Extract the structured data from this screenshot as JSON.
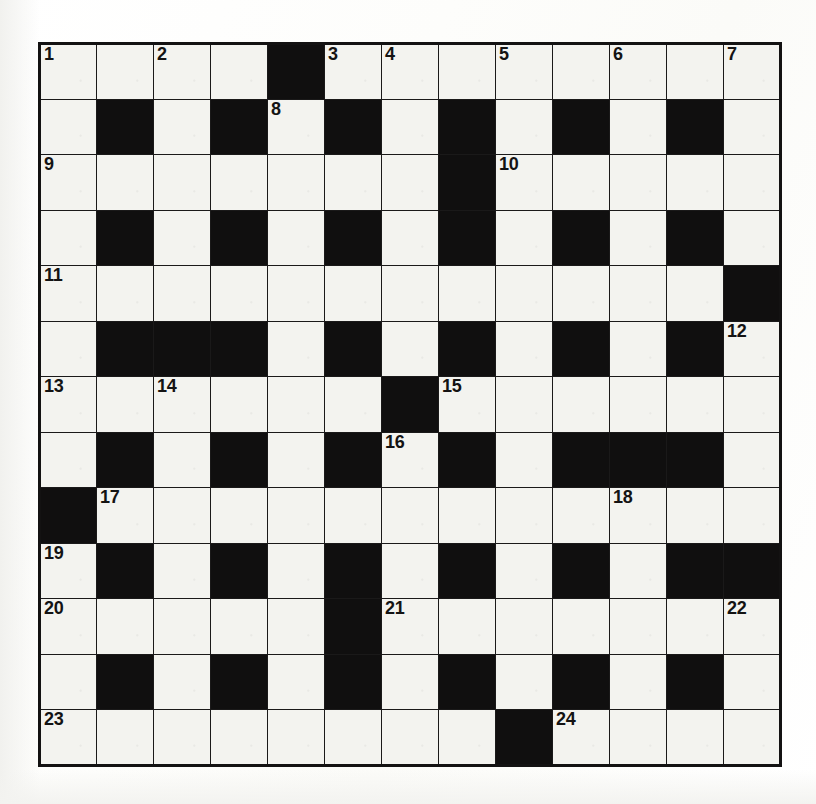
{
  "puzzle": {
    "kind": "crossword-grid",
    "columns": 13,
    "rows": 13,
    "colors": {
      "block": "#100f0f",
      "cell": "#f3f3ef",
      "grid_line": "#1a1919",
      "number_text": "#141313",
      "page_background": "#ffffff"
    },
    "number_labels": [
      "1",
      "2",
      "3",
      "4",
      "5",
      "6",
      "7",
      "8",
      "9",
      "10",
      "11",
      "12",
      "13",
      "14",
      "15",
      "16",
      "17",
      "18",
      "19",
      "20",
      "21",
      "22",
      "23",
      "24"
    ],
    "counts": {
      "total_cells": 169,
      "clue_numbers": 24
    },
    "grid": [
      [
        "1",
        "",
        "2",
        "",
        "#",
        "3",
        "4",
        "",
        "5",
        "",
        "6",
        "",
        "7"
      ],
      [
        "",
        "#",
        "",
        "#",
        "8",
        "#",
        "",
        "#",
        "",
        "#",
        "",
        "#",
        ""
      ],
      [
        "9",
        "",
        "",
        "",
        "",
        "",
        "",
        "#",
        "10",
        "",
        "",
        "",
        ""
      ],
      [
        "",
        "#",
        "",
        "#",
        "",
        "#",
        "",
        "#",
        "",
        "#",
        "",
        "#",
        ""
      ],
      [
        "11",
        "",
        "",
        "",
        "",
        "",
        "",
        "",
        "",
        "",
        "",
        "",
        "#"
      ],
      [
        "",
        "#",
        "#",
        "#",
        "",
        "#",
        "",
        "#",
        "",
        "#",
        "",
        "#",
        "12"
      ],
      [
        "13",
        "",
        "14",
        "",
        "",
        "",
        "#",
        "15",
        "",
        "",
        "",
        "",
        ""
      ],
      [
        "",
        "#",
        "",
        "#",
        "",
        "#",
        "16",
        "#",
        "",
        "#",
        "#",
        "#",
        ""
      ],
      [
        "#",
        "17",
        "",
        "",
        "",
        "",
        "",
        "",
        "",
        "",
        "18",
        "",
        ""
      ],
      [
        "19",
        "#",
        "",
        "#",
        "",
        "#",
        "",
        "#",
        "",
        "#",
        "",
        "#",
        "#"
      ],
      [
        "20",
        "",
        "",
        "",
        "",
        "#",
        "21",
        "",
        "",
        "",
        "",
        "",
        "22"
      ],
      [
        "",
        "#",
        "",
        "#",
        "",
        "#",
        "",
        "#",
        "",
        "#",
        "",
        "#",
        ""
      ],
      [
        "23",
        "",
        "",
        "",
        "",
        "",
        "",
        "",
        "#",
        "24",
        "",
        "",
        ""
      ]
    ]
  }
}
